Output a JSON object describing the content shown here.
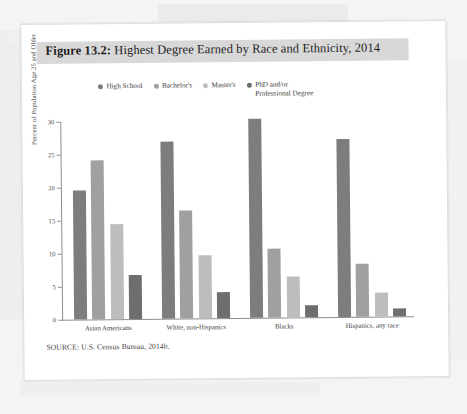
{
  "figure": {
    "label": "Figure 13.2:",
    "title": " Highest Degree Earned by Race and Ethnicity, 2014",
    "full_title": "Figure 13.2: Highest Degree Earned by Race and Ethnicity, 2014",
    "source": "SOURCE: U.S. Census Bureau, 2014b."
  },
  "colors": {
    "series_high_school": "#7d7d7d",
    "series_bachelors": "#a0a0a0",
    "series_masters": "#bdbdbd",
    "series_phd": "#6e6e6e",
    "title_band": "#d8d8d8",
    "axis": "#8e8e8e",
    "page": "#ffffff",
    "backdrop": "#f4f4f3"
  },
  "chart_data": {
    "type": "bar",
    "title": "Highest Degree Earned by Race and Ethnicity, 2014",
    "xlabel": "",
    "ylabel": "Percent of Population Age 25 and Older",
    "ylim": [
      0,
      30
    ],
    "yticks": [
      0,
      5,
      10,
      15,
      20,
      25,
      30
    ],
    "ytick_labels": [
      "0",
      "5",
      "10",
      "15",
      "20",
      "25",
      "30"
    ],
    "grid": false,
    "legend_position": "top-center",
    "categories": [
      "Asian Americans",
      "White, non-Hispanics",
      "Blacks",
      "Hispanics, any race"
    ],
    "series": [
      {
        "name": "High School",
        "color": "#7d7d7d",
        "values": [
          19.6,
          26.8,
          30.1,
          26.9
        ]
      },
      {
        "name": "Bachelor's",
        "color": "#a0a0a0",
        "values": [
          24.1,
          16.4,
          10.4,
          8.1
        ]
      },
      {
        "name": "Master's",
        "color": "#bdbdbd",
        "values": [
          14.4,
          9.6,
          6.2,
          3.7
        ]
      },
      {
        "name": "PhD and/or\nProfessional Degree",
        "color": "#6e6e6e",
        "values": [
          6.7,
          3.9,
          1.8,
          1.2
        ]
      }
    ]
  }
}
